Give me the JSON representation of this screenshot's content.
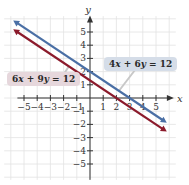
{
  "chart_data": {
    "type": "line",
    "title": "",
    "xlabel": "x",
    "ylabel": "y",
    "xlim": [
      -5.5,
      5.5
    ],
    "ylim": [
      -5.5,
      5.5
    ],
    "grid": true,
    "x_ticks": [
      -5,
      -4,
      -3,
      -2,
      -1,
      1,
      2,
      3,
      4,
      5
    ],
    "y_ticks": [
      5,
      4,
      3,
      2,
      1,
      -1,
      -2,
      -3,
      -4,
      -5
    ],
    "x_tick_labels": [
      "−5",
      "−4",
      "−3",
      "−2",
      "−1",
      "1",
      "2",
      "3",
      "4",
      "5"
    ],
    "y_tick_labels": [
      "5",
      "4",
      "3",
      "2",
      "1",
      "−1",
      "−2",
      "−3",
      "−4",
      "−5"
    ],
    "series": [
      {
        "name": "4x + 6y = 12",
        "color": "#4a6fa5",
        "equation": "y = -2/3 x + 2",
        "slope": -0.6667,
        "intercept": 2,
        "x": [
          -5.5,
          5.5
        ],
        "y": [
          5.667,
          -1.667
        ]
      },
      {
        "name": "6x + 9y = 12",
        "color": "#8b1a2b",
        "equation": "y = -2/3 x + 4/3",
        "slope": -0.6667,
        "intercept": 1.3333,
        "x": [
          -5.5,
          5.5
        ],
        "y": [
          5.0,
          -2.333
        ]
      }
    ],
    "annotations": [
      {
        "text": "4x + 6y = 12",
        "box_color": "#d5dde8",
        "points_to": "blue line"
      },
      {
        "text": "6x + 9y = 12",
        "box_color": "#e6d7dc",
        "points_to": "red line"
      }
    ]
  },
  "labels": {
    "blue": {
      "a": "4",
      "v1": "x",
      "op": " + ",
      "b": "6",
      "v2": "y",
      "rest": " = 12"
    },
    "red": {
      "a": "6",
      "v1": "x",
      "op": " + ",
      "b": "9",
      "v2": "y",
      "rest": " = 12"
    }
  }
}
